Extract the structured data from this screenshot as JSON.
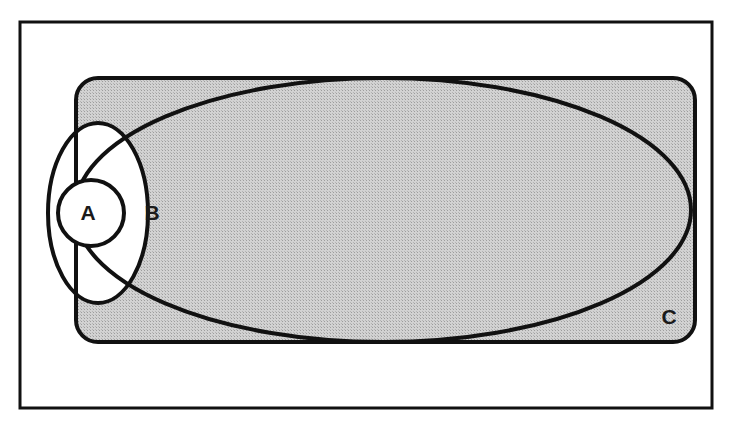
{
  "figure": {
    "kind": "euler-diagram",
    "caption": "",
    "background_color": "#ffffff",
    "ink_color": "#111111",
    "shade_color": "#c9c9c9",
    "unshaded_color": "#ffffff"
  },
  "frame": {
    "name": "outer-frame",
    "x": 20,
    "y": 22,
    "width": 692,
    "height": 386,
    "stroke_width": 3,
    "stroke_color": "#111111",
    "fill": "none"
  },
  "universe": {
    "name": "universal-set-rectangle",
    "x": 76,
    "y": 78,
    "width": 619,
    "height": 264,
    "corner_radius": 22,
    "fill": "#c9c9c9",
    "stroke_width": 4,
    "stroke_color": "#111111"
  },
  "sets": [
    {
      "id": "A",
      "label": "A",
      "shape": "circle",
      "cx": 91,
      "cy": 213,
      "rx": 33,
      "ry": 33,
      "rotation": 0,
      "fill": "#ffffff",
      "stroke_width": 4,
      "label_x": 88,
      "label_y": 214
    },
    {
      "id": "B",
      "label": "B",
      "shape": "ellipse",
      "cx": 98,
      "cy": 213,
      "rx": 50,
      "ry": 90,
      "rotation": 0,
      "fill": "#ffffff",
      "stroke_width": 4,
      "label_x": 152,
      "label_y": 214
    },
    {
      "id": "C",
      "label": "C",
      "shape": "ellipse",
      "cx": 383,
      "cy": 210,
      "rx": 308,
      "ry": 132,
      "rotation": 0,
      "fill": "none",
      "stroke_width": 4,
      "label_x": 669,
      "label_y": 318
    }
  ],
  "labels": {
    "a": "A",
    "b": "B",
    "c": "C"
  },
  "regions": [
    {
      "name": "A",
      "shaded": false,
      "note": "inner circle A, white"
    },
    {
      "name": "B minus A inside C",
      "shaded": false,
      "note": "lens between A and B, white"
    },
    {
      "name": "B minus C",
      "shaded": false,
      "note": "left sliver of B outside universe rectangle, white"
    },
    {
      "name": "C minus B",
      "shaded": true,
      "note": "large shaded ellipse interior"
    },
    {
      "name": "U minus C",
      "shaded": true,
      "note": "rectangle corners, shaded"
    }
  ]
}
